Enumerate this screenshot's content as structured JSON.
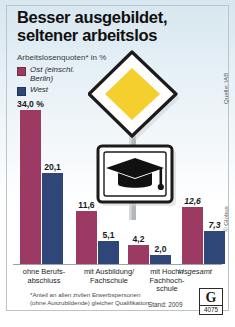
{
  "header": {
    "title_line1": "Besser ausgebildet,",
    "title_line2": "seltener arbeitslos",
    "subtitle": "Arbeitslosenquoten* in %"
  },
  "legend": {
    "items": [
      {
        "label_line1": "Ost (einschl.",
        "label_line2": "Berlin)",
        "color": "#9c3a63"
      },
      {
        "label_line1": "West",
        "label_line2": "",
        "color": "#2f4678"
      }
    ]
  },
  "footnote": {
    "line1": "*Anteil an allen zivilen Erwerbspersonen",
    "line2": "(ohne Auszubildende) gleicher Qualifikation",
    "stand": "Stand: 2009"
  },
  "credits": {
    "source": "Quelle: IAB",
    "copyright": "© Globus",
    "logo_letter": "G",
    "logo_number": "4075"
  },
  "icons": {
    "priority_road_sign": "priority-road-sign-icon",
    "graduation_cap_sign": "graduation-cap-sign-icon"
  },
  "chart_data": {
    "type": "bar",
    "title": "Besser ausgebildet, seltener arbeitslos",
    "subtitle": "Arbeitslosenquoten* in %",
    "ylabel": "%",
    "xlabel": "",
    "ylim": [
      0,
      34
    ],
    "grid": false,
    "legend_position": "top-left",
    "categories": [
      "ohne Berufs-\nabschluss",
      "mit Ausbildung/\nFachschule",
      "mit Hoch-/\nFachhoch-\nschule",
      "insgesamt"
    ],
    "category_labels": [
      {
        "line1": "ohne Berufs-",
        "line2": "abschluss",
        "line3": "",
        "italic": false
      },
      {
        "line1": "mit Ausbildung/",
        "line2": "Fachschule",
        "line3": "",
        "italic": false
      },
      {
        "line1": "mit Hoch-/",
        "line2": "Fachhoch-",
        "line3": "schule",
        "italic": false
      },
      {
        "line1": "insgesamt",
        "line2": "",
        "line3": "",
        "italic": true
      }
    ],
    "series": [
      {
        "name": "Ost (einschl. Berlin)",
        "color": "#9c3a63",
        "values": [
          34.0,
          11.6,
          4.2,
          12.6
        ],
        "value_labels": [
          "34,0 %",
          "11,6",
          "4,2",
          "12,6"
        ]
      },
      {
        "name": "West",
        "color": "#2f4678",
        "values": [
          20.1,
          5.1,
          2.0,
          7.3
        ],
        "value_labels": [
          "20,1",
          "5,1",
          "2,0",
          "7,3"
        ]
      }
    ]
  }
}
